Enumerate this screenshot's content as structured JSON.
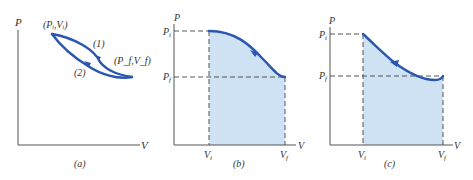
{
  "figure": {
    "panels": [
      {
        "id": "a",
        "caption": "(a)",
        "y_axis_label": "P",
        "x_axis_label": "V",
        "point_initial": "(P_i,V_i)",
        "point_initial_display": "(Pᵢ,Vᵢ)",
        "point_final": "(P_f,V_f)",
        "point_final_display": "(P_f,V_f)",
        "path_1_label": "(1)",
        "path_2_label": "(2)"
      },
      {
        "id": "b",
        "caption": "(b)",
        "y_axis_label": "P",
        "x_axis_label": "V",
        "pi_label": "P",
        "pi_sub": "i",
        "pf_label": "P",
        "pf_sub": "f",
        "vi_label": "V",
        "vi_sub": "i",
        "vf_label": "V",
        "vf_sub": "f"
      },
      {
        "id": "c",
        "caption": "(c)",
        "y_axis_label": "P",
        "x_axis_label": "V",
        "pi_label": "P",
        "pi_sub": "i",
        "pf_label": "P",
        "pf_sub": "f",
        "vi_label": "V",
        "vi_sub": "i",
        "vf_label": "V",
        "vf_sub": "f"
      }
    ],
    "colors": {
      "curve": "#2a55b0",
      "shade": "#cfe2f3",
      "axis": "#555555"
    }
  }
}
